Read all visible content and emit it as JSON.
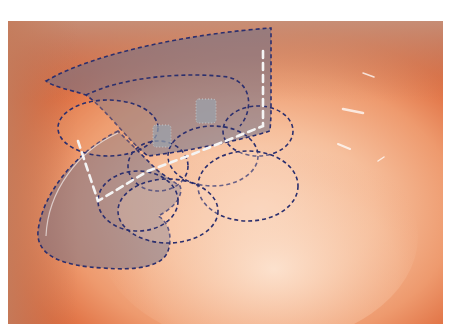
{
  "image": {
    "description": "Close-up photograph of a pinkish-orange anatomical cavity with bluish dashed-outline overlay shapes and white dashed guide lines",
    "background_color": "#ffffff",
    "photo_bounds": {
      "x": 8,
      "y": 21,
      "width": 435,
      "height": 303
    }
  },
  "colors": {
    "tissue_dark": "#d2522a",
    "tissue_mid": "#e9865c",
    "tissue_light": "#f6c2a2",
    "tissue_highlight": "#fbe2cf",
    "rim_tan": "#c98b6d",
    "overlay_fill": "#7b7a8f",
    "overlay_stroke": "#2b2f6e",
    "guide_line": "#f2f2f2",
    "marker_fill": "#9aa3ad"
  },
  "overlays": {
    "regions": [
      {
        "name": "upper-flap",
        "kind": "filled-dashed"
      },
      {
        "name": "lower-flap",
        "kind": "filled-dashed"
      },
      {
        "name": "ellipse-left",
        "kind": "dashed"
      },
      {
        "name": "ellipse-center",
        "kind": "dashed"
      },
      {
        "name": "ellipse-right-upper",
        "kind": "dashed"
      },
      {
        "name": "ellipse-right-lower",
        "kind": "dashed"
      },
      {
        "name": "ellipse-bottom",
        "kind": "dashed"
      },
      {
        "name": "ellipse-small-center",
        "kind": "dashed"
      }
    ],
    "markers": [
      {
        "name": "marker-left",
        "kind": "dotted-rect"
      },
      {
        "name": "marker-right",
        "kind": "dotted-rect"
      }
    ],
    "guide_lines": 2
  }
}
